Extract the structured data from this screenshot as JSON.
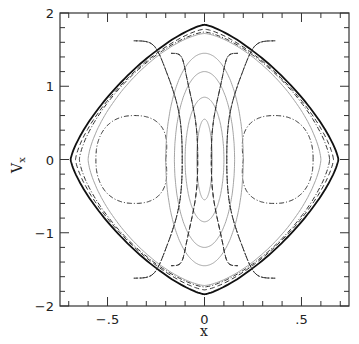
{
  "chart_data": {
    "type": "line",
    "title": "",
    "xlabel": "x",
    "ylabel": "V_x",
    "xlim": [
      -0.745,
      0.745
    ],
    "ylim": [
      -2,
      2
    ],
    "grid": false,
    "legend": null,
    "x_ticks": [
      {
        "value": -0.5,
        "label": "-.5"
      },
      {
        "value": 0,
        "label": "0"
      },
      {
        "value": 0.5,
        "label": ".5"
      }
    ],
    "y_ticks": [
      {
        "value": -2,
        "label": "-2"
      },
      {
        "value": -1,
        "label": "-1"
      },
      {
        "value": 0,
        "label": "0"
      },
      {
        "value": 1,
        "label": "1"
      },
      {
        "value": 2,
        "label": "2"
      }
    ],
    "x_minor_step": 0.1,
    "y_minor_step": 0.2,
    "series": [
      {
        "name": "outer-boundary",
        "style": "solid-black",
        "shape": "superellipse",
        "cx": 0,
        "cy": 0,
        "ax": 0.69,
        "ay": 1.84,
        "p": 1.35
      },
      {
        "name": "dashed-envelope",
        "style": "dashed",
        "shape": "superellipse",
        "cx": 0,
        "cy": 0,
        "ax": 0.665,
        "ay": 1.78,
        "p": 1.4
      },
      {
        "name": "dashdot-envelope",
        "style": "dashdot",
        "shape": "superellipse",
        "cx": 0,
        "cy": 0,
        "ax": 0.645,
        "ay": 1.74,
        "p": 1.45
      },
      {
        "name": "grey-envelope",
        "style": "solid-grey",
        "shape": "superellipse",
        "cx": 0,
        "cy": 0,
        "ax": 0.6,
        "ay": 1.72,
        "p": 1.5
      },
      {
        "name": "left-island",
        "style": "dashdot",
        "shape": "island",
        "cx": -0.36,
        "cy": 0,
        "ax": 0.2,
        "ay": 0.6,
        "p": 2.3
      },
      {
        "name": "right-island",
        "style": "dashdot",
        "shape": "island",
        "cx": 0.36,
        "cy": 0,
        "ax": 0.2,
        "ay": 0.6,
        "p": 2.3
      },
      {
        "name": "central-ellipse-1",
        "style": "solid-grey",
        "shape": "ellipse",
        "cx": 0,
        "cy": 0,
        "ax": 0.04,
        "ay": 0.55
      },
      {
        "name": "central-ellipse-2",
        "style": "solid-grey",
        "shape": "ellipse",
        "cx": 0,
        "cy": 0,
        "ax": 0.1,
        "ay": 0.85
      },
      {
        "name": "central-ellipse-3",
        "style": "solid-grey",
        "shape": "ellipse",
        "cx": 0,
        "cy": 0,
        "ax": 0.155,
        "ay": 1.2
      },
      {
        "name": "central-ellipse-4",
        "style": "solid-grey",
        "shape": "ellipse",
        "cx": 0,
        "cy": 0,
        "ax": 0.2,
        "ay": 1.45
      },
      {
        "name": "inner-separatrix",
        "style": "dashed",
        "shape": "lobe",
        "xin": 0.035,
        "xout": 0.33,
        "vtop": 1.45,
        "vmid": 0.75
      },
      {
        "name": "outer-separatrix",
        "style": "dashdot",
        "shape": "lobe",
        "xin": 0.115,
        "xout": 0.52,
        "vtop": 1.62,
        "vmid": 1.0
      }
    ]
  }
}
